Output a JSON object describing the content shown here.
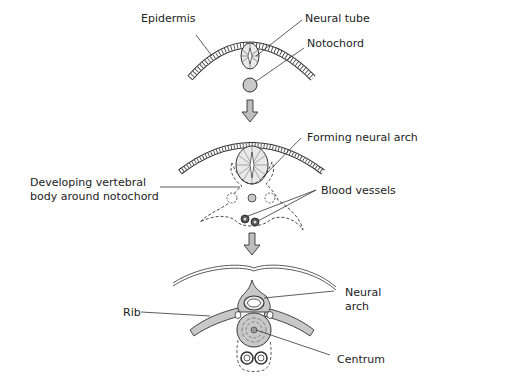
{
  "diagram": {
    "type": "developmental-sequence",
    "stages": [
      {
        "name": "stage-1",
        "labels": {
          "epidermis": "Epidermis",
          "neural_tube": "Neural tube",
          "notochord": "Notochord"
        }
      },
      {
        "name": "stage-2",
        "labels": {
          "forming_neural_arch": "Forming neural arch",
          "developing_body_line1": "Developing vertebral",
          "developing_body_line2": "body around notochord",
          "blood_vessels": "Blood vessels"
        }
      },
      {
        "name": "stage-3",
        "labels": {
          "rib": "Rib",
          "neural_arch_line1": "Neural",
          "neural_arch_line2": "arch",
          "centrum": "Centrum"
        }
      }
    ],
    "colors": {
      "ink": "#333333",
      "tissue_fill": "#c8c8c8",
      "light_fill": "#e6e6e6",
      "arrow_fill": "#bdbdbd",
      "background": "#ffffff"
    }
  }
}
